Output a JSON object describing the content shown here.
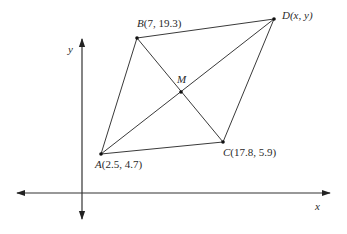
{
  "diagram": {
    "type": "coordinate-geometry",
    "axes": {
      "x_label": "x",
      "y_label": "y"
    },
    "points": {
      "A": {
        "name": "A",
        "coords": "(2.5, 4.7)"
      },
      "B": {
        "name": "B",
        "coords": "(7, 19.3)"
      },
      "C": {
        "name": "C",
        "coords": "(17.8, 5.9)"
      },
      "D": {
        "name": "D",
        "coords": "(x, y)"
      },
      "M": {
        "name": "M",
        "coords": ""
      }
    },
    "segments": [
      "AB",
      "BD",
      "DC",
      "CA",
      "AD",
      "BC"
    ],
    "colors": {
      "line": "#3a3a3a",
      "text": "#2a2a2a",
      "background": "#ffffff"
    }
  }
}
